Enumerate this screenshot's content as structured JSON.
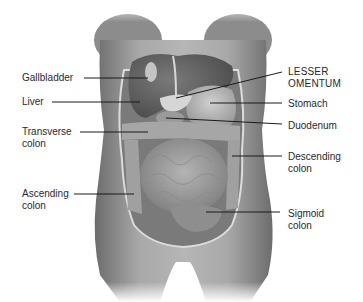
{
  "diagram": {
    "labels": {
      "gallbladder": "Gallbladder",
      "liver": "Liver",
      "transverse_colon": [
        "Transverse",
        "colon"
      ],
      "ascending_colon": [
        "Ascending",
        "colon"
      ],
      "lesser_omentum": [
        "LESSER",
        "OMENTUM"
      ],
      "stomach": "Stomach",
      "duodenum": "Duodenum",
      "descending_colon": [
        "Descending",
        "colon"
      ],
      "sigmoid_colon": [
        "Sigmoid",
        "colon"
      ]
    },
    "colors": {
      "background": "#ffffff",
      "skin": "#9a9a9a",
      "organ_dark": "#5e5e5e",
      "organ_light": "#b8b8b8",
      "leader_line": "#1a1a1a",
      "text": "#2a2a2a"
    }
  }
}
